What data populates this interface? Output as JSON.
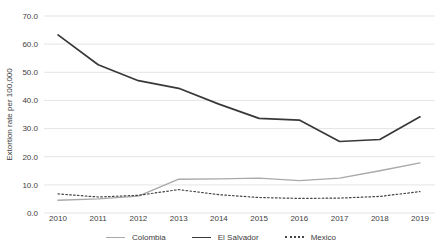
{
  "chart_data": {
    "type": "line",
    "title": "",
    "xlabel": "",
    "ylabel": "Extortion rate per 100,000",
    "x": [
      "2010",
      "2011",
      "2012",
      "2013",
      "2014",
      "2015",
      "2016",
      "2017",
      "2018",
      "2019"
    ],
    "ylim": [
      0,
      70
    ],
    "ytick_step": 10,
    "ytick_labels": [
      "0.0",
      "10.0",
      "20.0",
      "30.0",
      "40.0",
      "50.0",
      "60.0",
      "70.0"
    ],
    "grid": "horizontal",
    "grid_color": "#e5e5e5",
    "text_color": "#404040",
    "background_color": "#ffffff",
    "legend_position": "bottom-center",
    "series": [
      {
        "name": "Colombia",
        "style": "solid",
        "color": "#a9a9a9",
        "stroke_width": 1.4,
        "values": [
          4.5,
          5.0,
          6.0,
          12.0,
          12.1,
          12.4,
          11.5,
          12.4,
          15.0,
          17.8
        ]
      },
      {
        "name": "El Salvador",
        "style": "solid",
        "color": "#383838",
        "stroke_width": 1.7,
        "values": [
          63.3,
          52.7,
          47.0,
          44.3,
          38.7,
          33.6,
          33.0,
          25.4,
          26.1,
          34.2
        ]
      },
      {
        "name": "Mexico",
        "style": "dotted",
        "color": "#454545",
        "stroke_width": 1.2,
        "values": [
          6.8,
          5.7,
          6.3,
          8.3,
          6.5,
          5.5,
          5.2,
          5.3,
          5.9,
          7.6
        ]
      }
    ]
  }
}
